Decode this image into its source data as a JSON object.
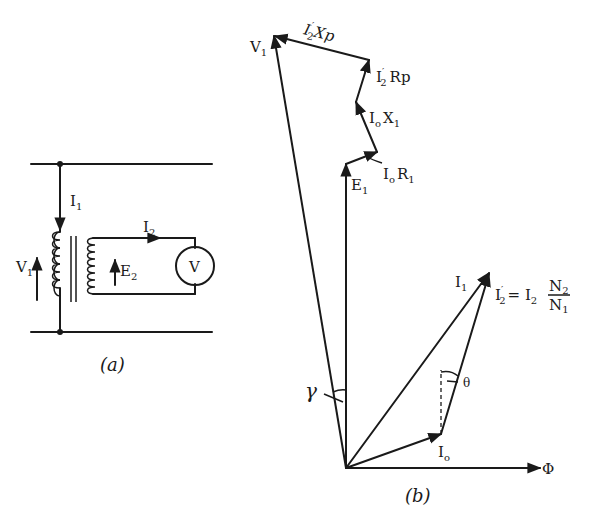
{
  "figure_a": {
    "caption": "(a)",
    "labels": {
      "i1": "I",
      "i1_sub": "1",
      "i2": "I",
      "i2_sub": "2",
      "v1": "V",
      "v1_sub": "1",
      "e2": "E",
      "e2_sub": "2",
      "meter": "V"
    }
  },
  "figure_b": {
    "caption": "(b)",
    "labels": {
      "v1": "V",
      "v1_sub": "1",
      "i2xp": "I",
      "i2xp_sub": "2",
      "i2xp_prime": "′",
      "i2xp_tail": "Xp",
      "i2rp": "I",
      "i2rp_sub": "2",
      "i2rp_prime": "′",
      "i2rp_tail": "Rp",
      "i0x1": "I",
      "i0x1_sub": "o",
      "i0x1_tail": "X",
      "i0x1_tail_sub": "1",
      "i0r1": "I",
      "i0r1_sub": "o",
      "i0r1_tail": "R",
      "i0r1_tail_sub": "1",
      "e1": "E",
      "e1_sub": "1",
      "i1": "I",
      "i1_sub": "1",
      "i2p_eq": "I",
      "i2p_eq_sub": "2",
      "i2p_eq_prime": "′",
      "i2p_eq_mid": "= I",
      "i2p_eq_mid_sub": "2",
      "frac_num": "N",
      "frac_num_sub": "2",
      "frac_den": "N",
      "frac_den_sub": "1",
      "i0": "I",
      "i0_sub": "o",
      "phi": "Φ",
      "gamma": "γ",
      "theta": "θ"
    }
  }
}
